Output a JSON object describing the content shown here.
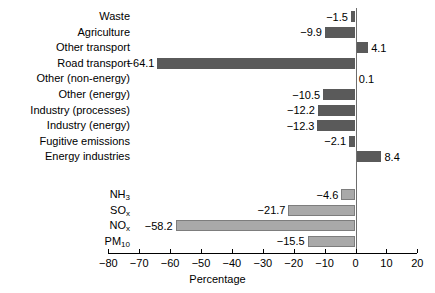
{
  "chart_data": {
    "type": "bar",
    "orientation": "horizontal",
    "title": "",
    "xlabel": "Percentage",
    "ylabel": "",
    "xlim": [
      -80,
      20
    ],
    "xticks": [
      -80,
      -70,
      -60,
      -50,
      -40,
      -30,
      -20,
      -10,
      0,
      10,
      20
    ],
    "xtick_labels": [
      "−80",
      "−70",
      "−60",
      "−50",
      "−40",
      "−30",
      "−20",
      "−10",
      "0",
      "10",
      "20"
    ],
    "grid": false,
    "legend": "none",
    "zero_reference_line": true,
    "groups": [
      {
        "name": "sectors",
        "color": "#5a5a5a",
        "categories": [
          "Waste",
          "Agriculture",
          "Other transport",
          "Road transport",
          "Other (non-energy)",
          "Other (energy)",
          "Industry (processes)",
          "Industry (energy)",
          "Fugitive emissions",
          "Energy industries"
        ],
        "values": [
          -1.5,
          -9.9,
          4.1,
          -64.1,
          0.1,
          -10.5,
          -12.2,
          -12.3,
          -2.1,
          8.4
        ],
        "value_labels": [
          "−1.5",
          "−9.9",
          "4.1",
          "−64.1",
          "0.1",
          "−10.5",
          "−12.2",
          "−12.3",
          "−2.1",
          "8.4"
        ]
      },
      {
        "name": "pollutants",
        "color": "#a9a9a9",
        "categories": [
          "NH3",
          "SOx",
          "NOx",
          "PM10"
        ],
        "categories_html": [
          "NH<sub>3</sub>",
          "SO<sub>x</sub>",
          "NO<sub>x</sub>",
          "PM<sub>10</sub>"
        ],
        "values": [
          -4.6,
          -21.7,
          -58.2,
          -15.5
        ],
        "value_labels": [
          "−4.6",
          "−21.7",
          "−58.2",
          "−15.5"
        ]
      }
    ]
  },
  "colors": {
    "bar_dark": "#5a5a5a",
    "bar_light": "#a9a9a9",
    "bar_light_edge": "#7d7d7d",
    "axis": "#000000",
    "zero_line": "#6e6e6e",
    "background": "#ffffff",
    "text": "#000000"
  }
}
